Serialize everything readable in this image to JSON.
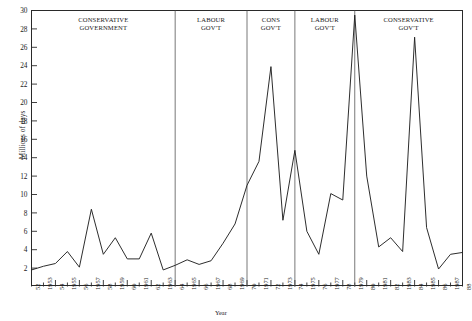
{
  "chart_data": {
    "type": "line",
    "title": "",
    "xlabel": "Year",
    "ylabel": "Millions of days",
    "ylim": [
      0,
      30
    ],
    "ytick_step": 2,
    "yticks": [
      2,
      4,
      6,
      8,
      10,
      12,
      14,
      16,
      18,
      20,
      22,
      24,
      26,
      28,
      30
    ],
    "xlim": [
      1952,
      1988
    ],
    "grid": false,
    "legend": null,
    "x": [
      1952,
      1953,
      1954,
      1955,
      1956,
      1957,
      1958,
      1959,
      1960,
      1961,
      1962,
      1963,
      1964,
      1965,
      1966,
      1967,
      1968,
      1969,
      1970,
      1971,
      1972,
      1973,
      1974,
      1975,
      1976,
      1977,
      1978,
      1979,
      1980,
      1981,
      1982,
      1983,
      1984,
      1985,
      1986,
      1987,
      1988
    ],
    "values": [
      1.8,
      2.2,
      2.5,
      3.8,
      2.1,
      8.4,
      3.5,
      5.3,
      3.0,
      3.0,
      5.8,
      1.8,
      2.3,
      2.9,
      2.4,
      2.8,
      4.7,
      6.8,
      11.0,
      13.6,
      23.9,
      7.2,
      14.8,
      6.0,
      3.5,
      10.1,
      9.4,
      29.5,
      12.0,
      4.3,
      5.3,
      3.8,
      27.1,
      6.4,
      1.9,
      3.5,
      3.7
    ],
    "xtick_labels": [
      "52",
      "1953",
      "54",
      "1955",
      "56",
      "1957",
      "58",
      "1959",
      "60",
      "1961",
      "62",
      "1963",
      "64",
      "1965",
      "66",
      "1967",
      "68",
      "1969",
      "70",
      "1971",
      "72",
      "1973",
      "74",
      "1975",
      "76",
      "1977",
      "78",
      "1979",
      "80",
      "1981",
      "82",
      "1983",
      "84",
      "1985",
      "86",
      "1987",
      "88"
    ],
    "annotations": [
      {
        "text_line1": "CONSERVATIVE",
        "text_line2": "GOVERNMENT",
        "start": 1952,
        "end": 1964
      },
      {
        "text_line1": "LABOUR",
        "text_line2": "GOV'T",
        "start": 1964,
        "end": 1970
      },
      {
        "text_line1": "CONS",
        "text_line2": "GOV'T",
        "start": 1970,
        "end": 1974
      },
      {
        "text_line1": "LABOUR",
        "text_line2": "GOV'T",
        "start": 1974,
        "end": 1979
      },
      {
        "text_line1": "CONSERVATIVE",
        "text_line2": "GOV'T",
        "start": 1979,
        "end": 1988
      }
    ],
    "divider_years": [
      1964,
      1970,
      1974,
      1979
    ],
    "line_color": "#222222",
    "axis_color": "#2a2a2a"
  }
}
